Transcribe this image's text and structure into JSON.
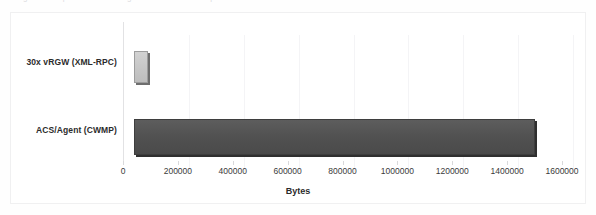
{
  "page": {
    "caption_remnant": "Figure : comparison of message overhead between protocols"
  },
  "chart_data": {
    "type": "bar",
    "orientation": "horizontal",
    "title": "",
    "subtitle": "",
    "categories": [
      "30x vRGW (XML-RPC)",
      "ACS/Agent (CWMP)"
    ],
    "values": [
      51000,
      1462000
    ],
    "series": [
      {
        "name": "Bytes",
        "values": [
          51000,
          1462000
        ],
        "colors": [
          "#c6c6c6",
          "#515151"
        ]
      }
    ],
    "xlabel": "Bytes",
    "ylabel": "",
    "xlim": [
      0,
      1600000
    ],
    "xticks": [
      0,
      200000,
      400000,
      600000,
      800000,
      1000000,
      1200000,
      1400000,
      1600000
    ],
    "xtick_labels": [
      "0",
      "200000",
      "400000",
      "600000",
      "800000",
      "1000000",
      "1200000",
      "1400000",
      "1600000"
    ],
    "grid": "vertical-only",
    "legend": "none",
    "bar_colors": {
      "light_bar": "#c6c6c6",
      "dark_bar": "#515151",
      "shadow": "#3f3f3f"
    }
  }
}
